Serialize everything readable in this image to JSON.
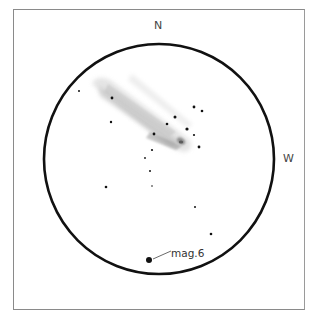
{
  "sketch": {
    "compass": {
      "north_label": "N",
      "west_label": "W"
    },
    "magnitude_label": "mag.6",
    "field_of_view": {
      "cx": 159,
      "cy": 159,
      "r": 115,
      "stroke": "#111111"
    },
    "comet": {
      "nucleus": {
        "x": 181,
        "y": 141
      },
      "tail_direction": "upper-left",
      "tail_color": "#9a9a9a"
    },
    "stars": [
      {
        "x": 79,
        "y": 91,
        "r": 1.0
      },
      {
        "x": 112,
        "y": 98,
        "r": 1.4
      },
      {
        "x": 111,
        "y": 122,
        "r": 1.2
      },
      {
        "x": 194,
        "y": 107,
        "r": 1.4
      },
      {
        "x": 202,
        "y": 111,
        "r": 1.3
      },
      {
        "x": 175,
        "y": 117,
        "r": 1.5
      },
      {
        "x": 167,
        "y": 124,
        "r": 1.3
      },
      {
        "x": 187,
        "y": 129,
        "r": 1.6
      },
      {
        "x": 194,
        "y": 135,
        "r": 1.1
      },
      {
        "x": 199,
        "y": 147,
        "r": 1.4
      },
      {
        "x": 154,
        "y": 134,
        "r": 1.4
      },
      {
        "x": 152,
        "y": 150,
        "r": 1.1
      },
      {
        "x": 145,
        "y": 158,
        "r": 0.9
      },
      {
        "x": 150,
        "y": 171,
        "r": 1.0
      },
      {
        "x": 106,
        "y": 187,
        "r": 1.3
      },
      {
        "x": 152,
        "y": 186,
        "r": 0.8
      },
      {
        "x": 195,
        "y": 207,
        "r": 1.0
      },
      {
        "x": 211,
        "y": 234,
        "r": 1.3
      },
      {
        "x": 149,
        "y": 260,
        "r": 3.0
      }
    ]
  }
}
